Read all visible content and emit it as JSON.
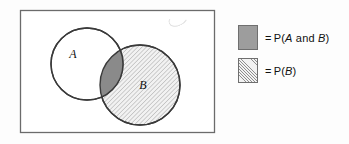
{
  "figure": {
    "type": "venn-diagram",
    "background_color": "#fdfdfd"
  },
  "diagram": {
    "universe_rect": {
      "label": "sample-space-rectangle",
      "x": 20,
      "y": 10,
      "width": 195,
      "height": 123,
      "stroke": "#6b6b6b",
      "fill": "#ffffff"
    },
    "circles": [
      {
        "id": "A",
        "label": "A",
        "cx": 87,
        "cy": 64,
        "r": 36,
        "stroke": "#3a3a3a",
        "fill": "#ffffff",
        "label_x": 73,
        "label_y": 58
      },
      {
        "id": "B",
        "label": "B",
        "cx": 140,
        "cy": 85,
        "r": 40,
        "stroke": "#3a3a3a",
        "fill": "hatch",
        "label_x": 143,
        "label_y": 89
      }
    ],
    "intersection": {
      "label": "A-and-B-overlap",
      "fill": "#8a8a8a",
      "stroke": "#3a3a3a"
    },
    "colors": {
      "solid_gray": "#9d9d9d",
      "overlap_gray": "#8a8a8a",
      "hatch_line": "#8e8e8e",
      "hatch_background": "#f2f2f2",
      "outline": "#3a3a3a",
      "rect_outline": "#6b6b6b",
      "text": "#111111"
    }
  },
  "legend": {
    "items": [
      {
        "swatch": "solid-gray-swatch",
        "equals": "=",
        "expression_prefix": "P(",
        "var_1": "A",
        "conjunction": " and ",
        "var_2": "B",
        "expression_suffix": ")",
        "full_text": "= P(A and B)"
      },
      {
        "swatch": "hatched-swatch",
        "equals": "=",
        "expression_prefix": "P(",
        "var_1": "B",
        "conjunction": "",
        "var_2": "",
        "expression_suffix": ")",
        "full_text": "= P(B)"
      }
    ]
  }
}
